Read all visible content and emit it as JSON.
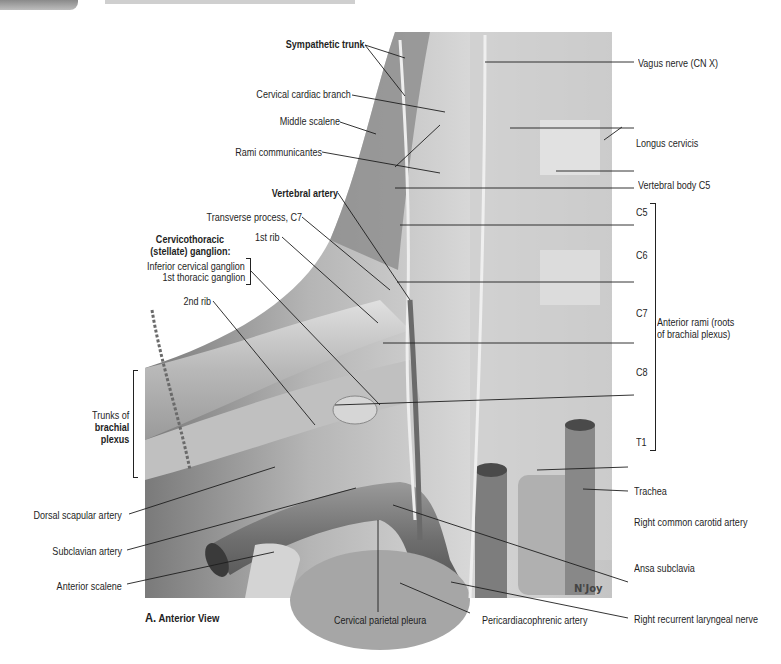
{
  "figure": {
    "caption_letter": "A.",
    "caption_view": "Anterior View",
    "signature": "N'Joy"
  },
  "labels_left": {
    "sympathetic_trunk": "Sympathetic trunk",
    "cervical_cardiac_branch": "Cervical cardiac branch",
    "middle_scalene": "Middle scalene",
    "rami_communicantes": "Rami communicantes",
    "vertebral_artery": "Vertebral artery",
    "transverse_process_c7": "Transverse process, C7",
    "first_rib": "1st rib",
    "stellate_heading_1": "Cervicothoracic",
    "stellate_heading_2": "(stellate) ganglion:",
    "inferior_cervical_ganglion": "Inferior cervical ganglion",
    "first_thoracic_ganglion": "1st thoracic ganglion",
    "second_rib": "2nd rib",
    "trunks_1": "Trunks of",
    "trunks_2": "brachial",
    "trunks_3": "plexus",
    "dorsal_scapular_artery": "Dorsal scapular artery",
    "subclavian_artery": "Subclavian artery",
    "anterior_scalene": "Anterior scalene"
  },
  "labels_bottom": {
    "cervical_parietal_pleura": "Cervical parietal pleura",
    "pericardiacophrenic_artery": "Pericardiacophrenic artery",
    "right_recurrent_laryngeal_nerve": "Right recurrent laryngeal nerve"
  },
  "labels_right": {
    "vagus_nerve": "Vagus nerve (CN X)",
    "longus_cervicis": "Longus cervicis",
    "vertebral_body_c5": "Vertebral body C5",
    "c5": "C5",
    "c6": "C6",
    "c7": "C7",
    "c8": "C8",
    "t1": "T1",
    "anterior_rami_1": "Anterior rami (roots",
    "anterior_rami_2": "of brachial plexus)",
    "trachea": "Trachea",
    "right_common_carotid_artery": "Right common carotid artery",
    "ansa_subclavia": "Ansa subclavia"
  },
  "colors": {
    "illustration_light": "#d9d9d9",
    "illustration_mid": "#a8a8a8",
    "illustration_dark": "#5e5e5e",
    "leader_line": "#1e1e1e"
  }
}
